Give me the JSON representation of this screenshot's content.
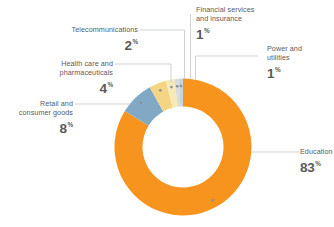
{
  "chart_data": {
    "type": "pie",
    "variant": "donut",
    "title": "",
    "subtitle": "",
    "xlabel": "",
    "ylabel": "",
    "unit": "%",
    "legend_position": "callout-labels",
    "grid": false,
    "total": 99,
    "categories": [
      "Education",
      "Retail and consumer goods",
      "Health care and pharmaceuticals",
      "Telecommunications",
      "Financial services and insurance",
      "Power and utilities"
    ],
    "values": [
      83,
      8,
      4,
      2,
      1,
      1
    ],
    "colors": [
      "#f7941e",
      "#81a9c6",
      "#f3d583",
      "#f7e9b8",
      "#d8dadb",
      "#c3d4dd"
    ],
    "slices": [
      {
        "label": "Education",
        "value": 83,
        "display": "83",
        "unit": "%",
        "color": "#f7941e"
      },
      {
        "label_line1": "Retail and",
        "label_line2": "consumer goods",
        "label": "Retail and consumer goods",
        "value": 8,
        "display": "8",
        "unit": "%",
        "color": "#81a9c6"
      },
      {
        "label_line1": "Health care and",
        "label_line2": "pharmaceuticals",
        "label": "Health care and pharmaceuticals",
        "value": 4,
        "display": "4",
        "unit": "%",
        "color": "#f3d583"
      },
      {
        "label_line1": "Telecommunications",
        "label_line2": "",
        "label": "Telecommunications",
        "value": 2,
        "display": "2",
        "unit": "%",
        "color": "#f7e9b8"
      },
      {
        "label_line1": "Financial services",
        "label_line2": "and insurance",
        "label": "Financial services and insurance",
        "value": 1,
        "display": "1",
        "unit": "%",
        "color": "#d8dadb"
      },
      {
        "label_line1": "Power and",
        "label_line2": "utilities",
        "label": "Power and utilities",
        "value": 1,
        "display": "1",
        "unit": "%",
        "color": "#c3d4dd"
      }
    ]
  },
  "style": {
    "accent": "#f7941e",
    "text": "#5a5b5d",
    "value_text": "#58595b",
    "leader_line": "#bcbec0",
    "background": "#ffffff"
  }
}
